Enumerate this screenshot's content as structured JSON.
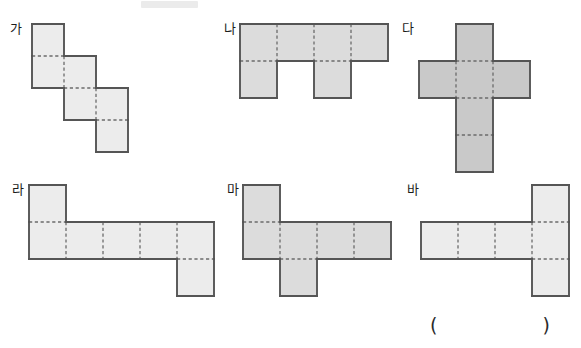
{
  "page": {
    "kind": "worksheet-figure-set",
    "width": 581,
    "height": 348,
    "background": "#ffffff"
  },
  "colors": {
    "fill_light": "#ececec",
    "fill_medium": "#dcdcdc",
    "fill_dark": "#c9c9c9",
    "outline": "#555555",
    "inner_dashed": "#6b6b6b",
    "text": "#1c1c1c",
    "smudge": "#ebebeb"
  },
  "answer": {
    "paren_left": "(",
    "paren_right": ")",
    "value": ""
  },
  "figures": [
    {
      "id": "ga",
      "label": "가",
      "label_x": 10,
      "label_y": 22,
      "origin_x": 30,
      "origin_y": 22,
      "cell": 32,
      "fill": "#ececec",
      "rows": 4,
      "cols": 3,
      "cells": [
        [
          1,
          0,
          0
        ],
        [
          1,
          1,
          0
        ],
        [
          0,
          1,
          1
        ],
        [
          0,
          0,
          1
        ]
      ],
      "cell_count": 6
    },
    {
      "id": "na",
      "label": "나",
      "label_x": 224,
      "label_y": 22,
      "origin_x": 238,
      "origin_y": 22,
      "cell": 37,
      "fill": "#dcdcdc",
      "rows": 2,
      "cols": 4,
      "cells": [
        [
          1,
          1,
          1,
          1
        ],
        [
          1,
          0,
          1,
          0
        ]
      ],
      "cell_count": 6
    },
    {
      "id": "da",
      "label": "다",
      "label_x": 402,
      "label_y": 22,
      "origin_x": 417,
      "origin_y": 22,
      "cell": 37,
      "fill": "#c9c9c9",
      "rows": 4,
      "cols": 3,
      "cells": [
        [
          0,
          1,
          0
        ],
        [
          1,
          1,
          1
        ],
        [
          0,
          1,
          0
        ],
        [
          0,
          1,
          0
        ]
      ],
      "cell_count": 6
    },
    {
      "id": "ra",
      "label": "라",
      "label_x": 12,
      "label_y": 183,
      "origin_x": 27,
      "origin_y": 183,
      "cell": 37,
      "fill": "#ececec",
      "rows": 3,
      "cols": 5,
      "cells": [
        [
          1,
          0,
          0,
          0,
          0
        ],
        [
          1,
          1,
          1,
          1,
          1
        ],
        [
          0,
          0,
          0,
          0,
          1
        ]
      ],
      "cell_count": 7
    },
    {
      "id": "ma",
      "label": "마",
      "label_x": 227,
      "label_y": 183,
      "origin_x": 241,
      "origin_y": 183,
      "cell": 37,
      "fill": "#dcdcdc",
      "rows": 3,
      "cols": 4,
      "cells": [
        [
          1,
          0,
          0,
          0
        ],
        [
          1,
          1,
          1,
          1
        ],
        [
          0,
          1,
          0,
          0
        ]
      ],
      "cell_count": 6
    },
    {
      "id": "ba",
      "label": "바",
      "label_x": 407,
      "label_y": 183,
      "origin_x": 419,
      "origin_y": 183,
      "cell": 37,
      "fill": "#ececec",
      "rows": 3,
      "cols": 4,
      "cells": [
        [
          0,
          0,
          0,
          1
        ],
        [
          1,
          1,
          1,
          1
        ],
        [
          0,
          0,
          0,
          1
        ]
      ],
      "cell_count": 6
    }
  ]
}
